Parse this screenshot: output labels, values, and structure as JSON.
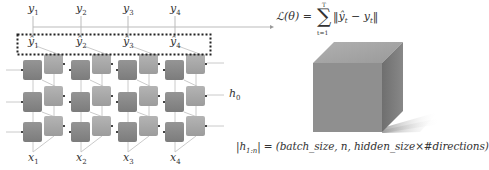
{
  "diagram": {
    "outputs": [
      "y1",
      "y2",
      "y3",
      "y4"
    ],
    "outputs_display": [
      {
        "base": "y",
        "sub": "1"
      },
      {
        "base": "y",
        "sub": "2"
      },
      {
        "base": "y",
        "sub": "3"
      },
      {
        "base": "y",
        "sub": "4"
      }
    ],
    "predictions_display": [
      {
        "base": "ŷ",
        "sub": "1"
      },
      {
        "base": "ŷ",
        "sub": "2"
      },
      {
        "base": "ŷ",
        "sub": "3"
      },
      {
        "base": "ŷ",
        "sub": "4"
      }
    ],
    "inputs_display": [
      {
        "base": "x",
        "sub": "1"
      },
      {
        "base": "x",
        "sub": "2"
      },
      {
        "base": "x",
        "sub": "3"
      },
      {
        "base": "x",
        "sub": "4"
      }
    ],
    "initial_hidden": {
      "base": "h",
      "sub": "0"
    },
    "loss": {
      "lhs": "ℒ(θ) =",
      "sigma": "∑",
      "upper": "T",
      "lower": "t=1",
      "body": "‖ŷ",
      "body_sub": "t",
      "body_mid": " − y",
      "body_sub2": "t",
      "body_end": "‖"
    },
    "layers": 3,
    "timesteps": 4,
    "directions": 2,
    "colors": {
      "forward_cell": "#8a8a8a",
      "backward_cell": "#a9a9a9",
      "cube_front": "#8f8f8f",
      "cube_top": "#a6a6a6",
      "cube_side": "#777777",
      "arrow": "#bbbbbb",
      "dotted_box": "#222222"
    },
    "tensor_shape": {
      "lhs": "|h",
      "lhs_sub": "1:n",
      "rhs": "| = (batch_size, n, hidden_size×#directions)"
    }
  }
}
